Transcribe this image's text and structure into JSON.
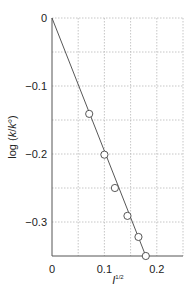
{
  "chart_data": {
    "type": "scatter",
    "title": "",
    "xlabel": "I",
    "xlabel_sup": "1/2",
    "ylabel": "log (k/k°)",
    "xlim": [
      0,
      0.25
    ],
    "ylim": [
      -0.35,
      0
    ],
    "grid": true,
    "x_ticks": [
      0,
      0.1,
      0.2
    ],
    "x_tick_labels": [
      "0",
      "0.1",
      "0.2"
    ],
    "y_ticks": [
      0,
      -0.1,
      -0.2,
      -0.3
    ],
    "y_tick_labels": [
      "0",
      "−0.1",
      "−0.2",
      "−0.3"
    ],
    "x_grid": [
      0.05,
      0.1,
      0.15,
      0.2,
      0.25
    ],
    "y_grid": [
      -0.05,
      -0.1,
      -0.15,
      -0.2,
      -0.25,
      -0.3
    ],
    "series": [
      {
        "name": "measured",
        "marker": "open-circle",
        "x": [
          0.071,
          0.1,
          0.12,
          0.144,
          0.165,
          0.179
        ],
        "y": [
          -0.141,
          -0.201,
          -0.25,
          -0.291,
          -0.322,
          -0.35
        ]
      }
    ],
    "fit_line": {
      "x": [
        0,
        0.179
      ],
      "y": [
        0,
        -0.35
      ]
    }
  }
}
